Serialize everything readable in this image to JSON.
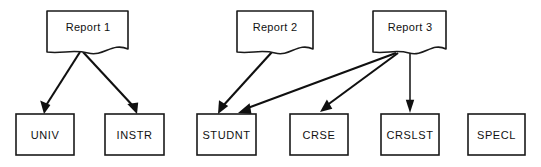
{
  "diagram": {
    "type": "data-flow-diagram",
    "canvas": {
      "width": 541,
      "height": 167,
      "background": "#ffffff"
    },
    "style": {
      "line_color": "#101010",
      "box_fill": "#ffffff",
      "box_stroke": "#1a1a1a",
      "text_color": "#111111"
    },
    "reports": [
      {
        "id": "report1",
        "label": "Report 1",
        "shape": "document",
        "x": 47,
        "y": 11,
        "w": 81,
        "h": 41,
        "label_x": 88,
        "label_y": 28
      },
      {
        "id": "report2",
        "label": "Report 2",
        "shape": "document",
        "x": 237,
        "y": 11,
        "w": 76,
        "h": 41,
        "label_x": 275,
        "label_y": 28
      },
      {
        "id": "report3",
        "label": "Report 3",
        "shape": "document",
        "x": 373,
        "y": 11,
        "w": 73,
        "h": 41,
        "label_x": 410,
        "label_y": 28
      }
    ],
    "stores": [
      {
        "id": "univ",
        "label": "UNIV",
        "shape": "rectangle",
        "x": 16,
        "y": 114,
        "w": 58,
        "h": 41,
        "label_x": 45,
        "label_y": 135
      },
      {
        "id": "instr",
        "label": "INSTR",
        "shape": "rectangle",
        "x": 105,
        "y": 114,
        "w": 59,
        "h": 41,
        "label_x": 135,
        "label_y": 135
      },
      {
        "id": "studnt",
        "label": "STUDNT",
        "shape": "rectangle",
        "x": 197,
        "y": 114,
        "w": 59,
        "h": 41,
        "label_x": 227,
        "label_y": 135
      },
      {
        "id": "crse",
        "label": "CRSE",
        "shape": "rectangle",
        "x": 290,
        "y": 114,
        "w": 58,
        "h": 41,
        "label_x": 319,
        "label_y": 135
      },
      {
        "id": "crslst",
        "label": "CRSLST",
        "shape": "rectangle",
        "x": 381,
        "y": 114,
        "w": 58,
        "h": 41,
        "label_x": 410,
        "label_y": 135
      },
      {
        "id": "specl",
        "label": "SPECL",
        "shape": "rectangle",
        "x": 468,
        "y": 114,
        "w": 57,
        "h": 41,
        "label_x": 497,
        "label_y": 135
      }
    ],
    "connections": [
      {
        "id": "report1-univ",
        "from": "report1",
        "to": "univ",
        "kind": "arrow"
      },
      {
        "id": "report1-instr",
        "from": "report1",
        "to": "instr",
        "kind": "arrow"
      },
      {
        "id": "report2-studnt",
        "from": "report2",
        "to": "studnt",
        "kind": "arrow"
      },
      {
        "id": "report3-studnt",
        "from": "report3",
        "to": "studnt",
        "kind": "arrow"
      },
      {
        "id": "report3-crse",
        "from": "report3",
        "to": "crse",
        "kind": "arrow"
      },
      {
        "id": "report3-crslst",
        "from": "report3",
        "to": "crslst",
        "kind": "arrow"
      }
    ]
  }
}
